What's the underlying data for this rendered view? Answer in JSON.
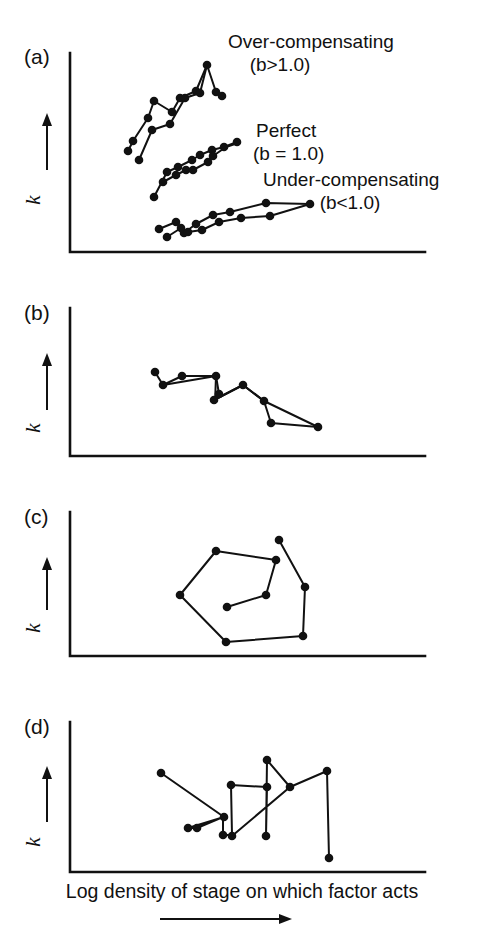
{
  "figure": {
    "background_color": "#ffffff",
    "ink_color": "#111111",
    "width": 485,
    "height": 944,
    "caption": "Log density of stage on which factor acts",
    "caption_arrow": "rightward-arrow",
    "y_axis_symbol": "k",
    "y_axis_arrow": "upward-arrow"
  },
  "panels": [
    {
      "id": "a",
      "label": "(a)",
      "axes": {
        "x0": 70,
        "y_top": 53,
        "y_bottom": 252,
        "x_end": 425
      },
      "annotations": [
        {
          "name": "over-compensating",
          "line1": "Over-compensating",
          "line2": "(b>1.0)",
          "x": 228,
          "y": 48,
          "x2": 280,
          "y2": 71
        },
        {
          "name": "perfect",
          "line1": "Perfect",
          "line2": "(b = 1.0)",
          "x": 256,
          "y": 137,
          "x2": 253,
          "y2": 160
        },
        {
          "name": "under-compensating",
          "line1": "Under-compensating",
          "line2": "(b<1.0)",
          "x": 263,
          "y": 186,
          "x2": 320,
          "y2": 209
        }
      ],
      "series": [
        {
          "name": "over-compensating-run-1",
          "points": [
            [
              128,
              151
            ],
            [
              133,
              141
            ],
            [
              148,
              118
            ],
            [
              154,
              101
            ],
            [
              172,
              112
            ],
            [
              180,
              98
            ],
            [
              196,
              91
            ],
            [
              207,
              65
            ]
          ]
        },
        {
          "name": "over-compensating-run-2",
          "points": [
            [
              139,
              160
            ],
            [
              152,
              130
            ],
            [
              170,
              124
            ],
            [
              185,
              98
            ],
            [
              200,
              93
            ],
            [
              207,
              65
            ],
            [
              216,
              92
            ],
            [
              222,
              96
            ]
          ]
        }
      ]
    },
    {
      "id": "b",
      "label": "(b)",
      "axes": {
        "x0": 70,
        "y_top": 308,
        "y_bottom": 456,
        "x_end": 425
      },
      "series": [
        {
          "name": "b-run-1",
          "points": [
            [
              155,
              372
            ],
            [
              163,
              385
            ],
            [
              216,
              376
            ],
            [
              219,
              394
            ],
            [
              214,
              400
            ],
            [
              243,
              385
            ],
            [
              264,
              401
            ],
            [
              271,
              423
            ],
            [
              318,
              427
            ]
          ]
        },
        {
          "name": "b-run-2",
          "points": [
            [
              182,
              376
            ],
            [
              216,
              376
            ],
            [
              215,
              403
            ],
            [
              243,
              385
            ],
            [
              264,
              401
            ],
            [
              270,
              423
            ],
            [
              318,
              427
            ]
          ]
        }
      ]
    },
    {
      "id": "c",
      "label": "(c)",
      "axes": {
        "x0": 70,
        "y_top": 512,
        "y_bottom": 656,
        "x_end": 425
      },
      "series": [
        {
          "name": "c-spiral",
          "points": [
            [
              279,
              540
            ],
            [
              305,
              587
            ],
            [
              303,
              636
            ],
            [
              226,
              642
            ],
            [
              180,
              595
            ],
            [
              216,
              551
            ],
            [
              276,
              560
            ],
            [
              266,
              595
            ],
            [
              227,
              607
            ]
          ]
        }
      ]
    },
    {
      "id": "d",
      "label": "(d)",
      "axes": {
        "x0": 70,
        "y_top": 722,
        "y_bottom": 872,
        "x_end": 425
      },
      "series": [
        {
          "name": "d-chaotic",
          "points": [
            [
              161,
              773
            ],
            [
              224,
              817
            ],
            [
              188,
              828
            ],
            [
              197,
              828
            ],
            [
              223,
              817
            ],
            [
              223,
              835
            ],
            [
              232,
              835
            ],
            [
              231,
              785
            ],
            [
              267,
              787
            ],
            [
              266,
              836
            ],
            [
              268,
              836
            ],
            [
              267,
              760
            ],
            [
              290,
              787
            ],
            [
              288,
              787
            ],
            [
              232,
              836
            ],
            [
              230,
              836
            ],
            [
              290,
              787
            ],
            [
              327,
              771
            ],
            [
              329,
              858
            ]
          ]
        }
      ]
    }
  ]
}
